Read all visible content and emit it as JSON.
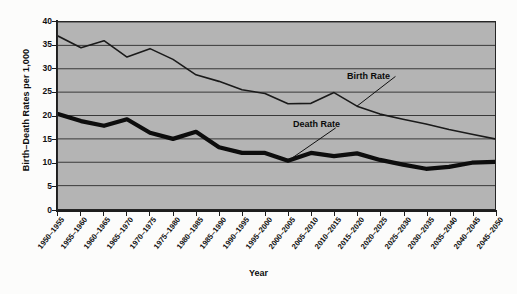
{
  "chart_data": {
    "type": "line",
    "title": "",
    "xlabel": "Year",
    "ylabel": "Birth–Death Rates per 1,000",
    "ylim": [
      0,
      40
    ],
    "yticks": [
      0,
      5,
      10,
      15,
      20,
      25,
      30,
      35,
      40
    ],
    "ytick_labels": [
      "0",
      "5",
      "10",
      "15",
      "20",
      "25",
      "30",
      "35",
      "40"
    ],
    "grid": true,
    "grid_axis": "y",
    "legend": "annotations-on-plot",
    "plot_background": "#b4b4b4",
    "categories": [
      "1950–1955",
      "1955–1960",
      "1960–1965",
      "1965–1970",
      "1970–1975",
      "1975–1980",
      "1980–1985",
      "1985–1990",
      "1990–1995",
      "1995–2000",
      "2000–2005",
      "2005–2010",
      "2010–2015",
      "2015–2020",
      "2020–2025",
      "2025–2030",
      "2030–2035",
      "2035–2040",
      "2040–2045",
      "2045–2050"
    ],
    "series": [
      {
        "name": "Birth Rate",
        "color": "#1a1a1a",
        "line_width": 1.6,
        "values": [
          37.0,
          34.5,
          36.0,
          32.5,
          34.3,
          32.0,
          28.7,
          27.3,
          25.5,
          24.7,
          22.5,
          22.6,
          24.9,
          22.0,
          20.3,
          19.2,
          18.2,
          17.0,
          16.0,
          15.0
        ]
      },
      {
        "name": "Death Rate",
        "color": "#0d0d0d",
        "line_width": 4.2,
        "values": [
          20.3,
          18.8,
          17.8,
          19.2,
          16.3,
          15.0,
          16.5,
          13.2,
          12.0,
          12.0,
          10.3,
          12.0,
          11.3,
          11.9,
          10.5,
          9.5,
          8.6,
          9.0,
          9.9,
          10.1
        ]
      }
    ],
    "annotations": [
      {
        "text": "Birth Rate",
        "target_index": 13,
        "target_value": 22.0
      },
      {
        "text": "Death Rate",
        "target_index": 10,
        "target_value": 10.3
      }
    ]
  }
}
